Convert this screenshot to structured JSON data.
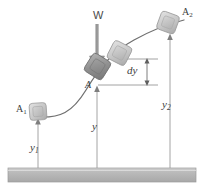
{
  "figure": {
    "ground": {
      "name": "ground-datum-bar",
      "fill": "#b9b9b9",
      "stroke": "#8f8f8f"
    },
    "curve": {
      "name": "curved-path",
      "stroke": "#6e6e6e"
    },
    "colors": {
      "line": "#808080",
      "text": "#3d3d3d",
      "block_light": "#c9c9c9",
      "block_mid": "#b0b0b0",
      "block_dark": "#8a8a8a",
      "ground": "#b9b9b9",
      "arrow": "#8c8c8c"
    },
    "labels": {
      "weight": "W",
      "point_a": "A",
      "block_1": "A",
      "block_1_sub": "1",
      "block_2": "A",
      "block_2_sub": "2",
      "height_1": "y",
      "height_1_sub": "1",
      "height_mid": "y",
      "height_2": "y",
      "height_2_sub": "2",
      "differential": "dy"
    },
    "blocks": [
      {
        "name": "block-a1",
        "label": "A1",
        "x": 30,
        "y": 103,
        "size": 17,
        "rotation": 0
      },
      {
        "name": "block-a-dark",
        "label": "A",
        "x": 87,
        "y": 56,
        "size": 21,
        "rotation": 30
      },
      {
        "name": "block-a-light",
        "label": "A displaced",
        "x": 110,
        "y": 43,
        "size": 20,
        "rotation": 26
      },
      {
        "name": "block-a2",
        "label": "A2",
        "x": 158,
        "y": 13,
        "size": 19,
        "rotation": 18
      }
    ],
    "dimension_arrows": [
      {
        "name": "y1-dimension-arrow",
        "label": "y1",
        "from_y": 168,
        "to_y": 121,
        "x": 38
      },
      {
        "name": "y-dimension-arrow",
        "label": "y",
        "from_y": 168,
        "to_y": 88,
        "x": 97
      },
      {
        "name": "y2-dimension-arrow",
        "label": "y2",
        "from_y": 168,
        "to_y": 36,
        "x": 170
      },
      {
        "name": "dy-dimension-arrow",
        "label": "dy",
        "from_y": 85,
        "to_y": 59,
        "x": 147
      }
    ]
  }
}
